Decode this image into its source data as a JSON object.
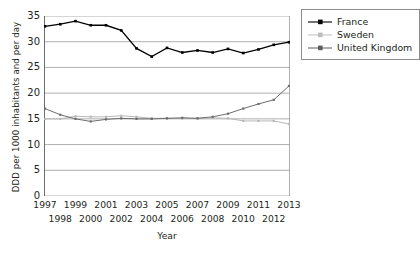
{
  "chart_data": {
    "type": "line",
    "title": "",
    "xlabel": "Year",
    "ylabel": "DDD per 1000 inhabitants and per day",
    "xlim": [
      1997,
      2013
    ],
    "ylim": [
      0,
      35
    ],
    "yticks": [
      0,
      5,
      10,
      15,
      20,
      25,
      30,
      35
    ],
    "grid": "horizontal",
    "legend_position": "top-right-outside",
    "x": [
      1997,
      1998,
      1999,
      2000,
      2001,
      2002,
      2003,
      2004,
      2005,
      2006,
      2007,
      2008,
      2009,
      2010,
      2011,
      2012,
      2013
    ],
    "categories": [
      "1997",
      "1998",
      "1999",
      "2000",
      "2001",
      "2002",
      "2003",
      "2004",
      "2005",
      "2006",
      "2007",
      "2008",
      "2009",
      "2010",
      "2011",
      "2012",
      "2013"
    ],
    "xtick_rows": [
      {
        "row": 0,
        "labels": [
          "1997",
          "1999",
          "2001",
          "2003",
          "2005",
          "2007",
          "2009",
          "2011",
          "2013"
        ]
      },
      {
        "row": 1,
        "labels": [
          "1998",
          "2000",
          "2002",
          "2004",
          "2006",
          "2008",
          "2010",
          "2012"
        ]
      }
    ],
    "series": [
      {
        "name": "France",
        "color": "#000000",
        "marker": "square",
        "values": [
          33.0,
          33.4,
          34.0,
          33.2,
          33.2,
          32.2,
          28.7,
          27.1,
          28.8,
          27.9,
          28.3,
          27.9,
          28.6,
          27.8,
          28.5,
          29.4,
          29.9
        ]
      },
      {
        "name": "Sweden",
        "color": "#b9b9b9",
        "marker": "square",
        "values": [
          15.0,
          15.0,
          15.5,
          15.4,
          15.4,
          15.6,
          15.4,
          15.1,
          15.1,
          15.1,
          15.1,
          15.2,
          15.1,
          14.6,
          14.6,
          14.6,
          14.0
        ]
      },
      {
        "name": "United Kingdom",
        "color": "#6e6e6e",
        "marker": "square",
        "values": [
          17.0,
          15.8,
          15.0,
          14.5,
          14.9,
          15.1,
          15.0,
          15.0,
          15.1,
          15.2,
          15.1,
          15.4,
          16.0,
          17.0,
          17.9,
          18.7,
          19.5
        ]
      }
    ],
    "series_tail_override": {
      "United Kingdom": {
        "2013": 21.4
      }
    }
  },
  "legend": {
    "items": [
      {
        "label": "France"
      },
      {
        "label": "Sweden"
      },
      {
        "label": "United Kingdom"
      }
    ]
  },
  "axis": {
    "y_title": "DDD per 1000 inhabitants and per day",
    "x_title": "Year"
  }
}
